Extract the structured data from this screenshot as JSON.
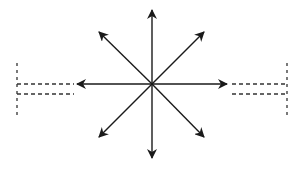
{
  "diagram": {
    "type": "radial-arrows",
    "center": [
      152,
      84
    ],
    "stroke_color": "#1a1a1a",
    "dash_color": "#333333",
    "arrows": [
      {
        "direction": "up",
        "tip": [
          152,
          10
        ]
      },
      {
        "direction": "up-right",
        "tip": [
          204,
          32
        ]
      },
      {
        "direction": "right",
        "tip": [
          227,
          84
        ]
      },
      {
        "direction": "down-right",
        "tip": [
          204,
          137
        ]
      },
      {
        "direction": "down",
        "tip": [
          152,
          158
        ]
      },
      {
        "direction": "down-left",
        "tip": [
          99,
          137
        ]
      },
      {
        "direction": "left",
        "tip": [
          77,
          84
        ]
      },
      {
        "direction": "up-left",
        "tip": [
          99,
          32
        ]
      }
    ],
    "brackets": [
      {
        "side": "left",
        "vertical_x": 17,
        "y_top": 63,
        "y_bottom": 117,
        "line_y": [
          84,
          94
        ],
        "line_x_end": 74
      },
      {
        "side": "right",
        "vertical_x": 287,
        "y_top": 63,
        "y_bottom": 117,
        "line_y": [
          84,
          94
        ],
        "line_x_start": 232
      }
    ]
  }
}
